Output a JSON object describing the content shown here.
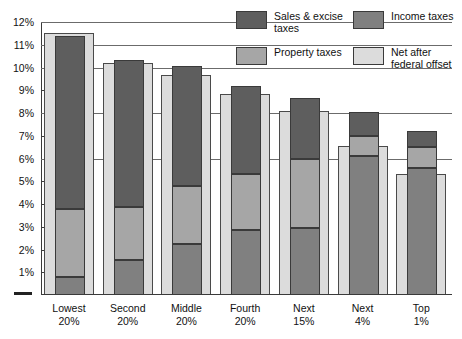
{
  "chart_data": {
    "type": "bar",
    "title": "",
    "subtitle": "",
    "xlabel": "",
    "ylabel": "",
    "stacked": true,
    "grid": true,
    "ylim": [
      0,
      12
    ],
    "ytick_labels": [
      "12%",
      "11%",
      "10%",
      "9%",
      "8%",
      "7%",
      "6%",
      "5%",
      "4%",
      "3%",
      "2%",
      "1%"
    ],
    "ytick_values": [
      12,
      11,
      10,
      9,
      8,
      7,
      6,
      5,
      4,
      3,
      2,
      1
    ],
    "categories": [
      "Lowest\n20%",
      "Second\n20%",
      "Middle\n20%",
      "Fourth\n20%",
      "Next\n15%",
      "Next\n4%",
      "Top\n1%"
    ],
    "category_lines": [
      [
        "Lowest",
        "20%"
      ],
      [
        "Second",
        "20%"
      ],
      [
        "Middle",
        "20%"
      ],
      [
        "Fourth",
        "20%"
      ],
      [
        "Next",
        "15%"
      ],
      [
        "Next",
        "4%"
      ],
      [
        "Top",
        "1%"
      ]
    ],
    "legend_position": "top-right",
    "series": [
      {
        "name": "Income taxes",
        "key": "income",
        "color": "#808080",
        "values": [
          0.8,
          1.55,
          2.25,
          2.85,
          2.95,
          6.1,
          5.6
        ]
      },
      {
        "name": "Property taxes",
        "key": "property",
        "color": "#a6a6a6",
        "values": [
          3.0,
          2.3,
          2.55,
          2.45,
          3.05,
          0.9,
          0.9
        ]
      },
      {
        "name": "Sales & excise taxes",
        "key": "sales",
        "color": "#5e5e5e",
        "values": [
          7.6,
          6.5,
          5.25,
          3.9,
          2.65,
          1.05,
          0.7
        ]
      },
      {
        "name": "Net after federal offset",
        "key": "net",
        "color": "#dcdcdc",
        "overlay": true,
        "values": [
          11.5,
          10.2,
          9.65,
          8.85,
          8.1,
          6.55,
          5.3
        ]
      }
    ],
    "totals": [
      11.4,
      10.35,
      10.05,
      9.2,
      8.65,
      8.05,
      7.2
    ],
    "stack_tops": {
      "income": [
        0.8,
        1.55,
        2.25,
        2.85,
        2.95,
        6.1,
        5.6
      ],
      "property": [
        3.8,
        3.85,
        4.8,
        5.3,
        6.0,
        7.0,
        6.5
      ],
      "sales": [
        11.4,
        10.35,
        10.05,
        9.2,
        8.65,
        8.05,
        7.2
      ]
    }
  },
  "legend": {
    "items": [
      {
        "label": "Sales & excise taxes",
        "swatch": "sw-sales"
      },
      {
        "label": "Income taxes",
        "swatch": "sw-income"
      },
      {
        "label": "Property taxes",
        "swatch": "sw-property"
      },
      {
        "label": "Net after federal offset",
        "swatch": "sw-net"
      }
    ]
  }
}
